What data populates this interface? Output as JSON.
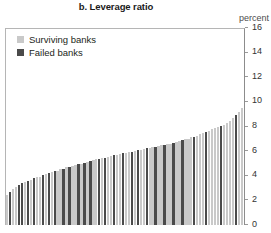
{
  "chart": {
    "title": "b. Leverage ratio",
    "unit_label": "percent"
  },
  "legend": {
    "items": [
      {
        "label": "Surviving banks",
        "swatch": "light-gray-swatch",
        "color": "#c9c9c9"
      },
      {
        "label": "Failed banks",
        "swatch": "dark-gray-swatch",
        "color": "#4a4a4a"
      }
    ]
  },
  "y_axis": {
    "ticks": [
      "16",
      "14",
      "12",
      "10",
      "8",
      "6",
      "4",
      "2",
      "0"
    ]
  },
  "chart_data": {
    "type": "bar",
    "title": "b. Leverage ratio",
    "subtitle": "",
    "xlabel": "",
    "ylabel": "percent",
    "ylim": [
      0,
      16
    ],
    "ytick_values": [
      0,
      2,
      4,
      6,
      8,
      10,
      12,
      14,
      16
    ],
    "grid": false,
    "legend_position": "top-left",
    "x_axis_visible": false,
    "categories": [
      "b1",
      "b2",
      "b3",
      "b4",
      "b5",
      "b6",
      "b7",
      "b8",
      "b9",
      "b10",
      "b11",
      "b12",
      "b13",
      "b14",
      "b15",
      "b16",
      "b17",
      "b18",
      "b19",
      "b20",
      "b21",
      "b22",
      "b23",
      "b24",
      "b25",
      "b26",
      "b27",
      "b28",
      "b29",
      "b30",
      "b31",
      "b32",
      "b33",
      "b34",
      "b35",
      "b36",
      "b37",
      "b38",
      "b39",
      "b40",
      "b41",
      "b42",
      "b43",
      "b44",
      "b45",
      "b46",
      "b47",
      "b48",
      "b49",
      "b50",
      "b51",
      "b52",
      "b53",
      "b54",
      "b55",
      "b56",
      "b57",
      "b58",
      "b59",
      "b60",
      "b61",
      "b62",
      "b63",
      "b64",
      "b65",
      "b66",
      "b67",
      "b68",
      "b69",
      "b70",
      "b71",
      "b72",
      "b73",
      "b74",
      "b75",
      "b76",
      "b77",
      "b78",
      "b79",
      "b80"
    ],
    "values": [
      2.45,
      2.7,
      2.95,
      3.1,
      3.25,
      3.4,
      3.5,
      3.6,
      3.7,
      3.8,
      3.9,
      3.95,
      4.05,
      4.15,
      4.25,
      4.3,
      4.4,
      4.45,
      4.55,
      4.6,
      4.7,
      4.75,
      4.8,
      4.9,
      4.95,
      5.0,
      5.1,
      5.15,
      5.2,
      5.3,
      5.35,
      5.4,
      5.45,
      5.5,
      5.55,
      5.6,
      5.7,
      5.75,
      5.8,
      5.85,
      5.9,
      5.95,
      6.0,
      6.05,
      6.1,
      6.15,
      6.2,
      6.25,
      6.3,
      6.35,
      6.4,
      6.45,
      6.5,
      6.55,
      6.6,
      6.65,
      6.7,
      6.8,
      6.85,
      6.9,
      7.0,
      7.05,
      7.15,
      7.2,
      7.3,
      7.4,
      7.5,
      7.6,
      7.7,
      7.8,
      7.9,
      8.0,
      8.1,
      8.2,
      8.35,
      8.5,
      8.7,
      8.95,
      9.2,
      9.55
    ],
    "series": [
      {
        "name": "Surviving banks",
        "color": "#c9c9c9",
        "bar_indices": [
          0,
          2,
          3,
          6,
          8,
          10,
          11,
          13,
          15,
          17,
          18,
          20,
          22,
          23,
          25,
          27,
          29,
          30,
          32,
          34,
          35,
          37,
          38,
          40,
          41,
          43,
          45,
          46,
          48,
          49,
          51,
          52,
          54,
          55,
          57,
          58,
          60,
          61,
          62,
          64,
          65,
          66,
          68,
          69,
          70,
          71,
          73,
          74,
          75,
          76,
          78,
          79
        ]
      },
      {
        "name": "Failed banks",
        "color": "#4a4a4a",
        "bar_indices": [
          1,
          4,
          5,
          7,
          9,
          12,
          14,
          16,
          19,
          21,
          24,
          26,
          28,
          31,
          33,
          36,
          39,
          42,
          44,
          47,
          50,
          53,
          56,
          59,
          63,
          67,
          72,
          77
        ]
      }
    ]
  }
}
